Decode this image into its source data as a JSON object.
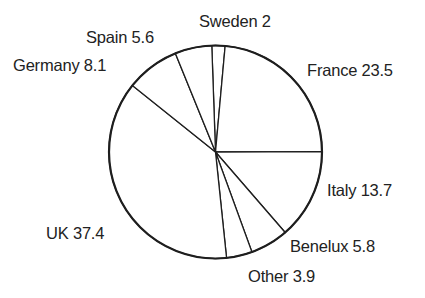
{
  "chart_data": {
    "type": "pie",
    "title": "",
    "slices": [
      {
        "label": "Sweden",
        "value": 2
      },
      {
        "label": "France",
        "value": 23.5
      },
      {
        "label": "Italy",
        "value": 13.7
      },
      {
        "label": "Benelux",
        "value": 5.8
      },
      {
        "label": "Other",
        "value": 3.9
      },
      {
        "label": "UK",
        "value": 37.4
      },
      {
        "label": "Germany",
        "value": 8.1
      },
      {
        "label": "Spain",
        "value": 5.6
      }
    ],
    "labels_text": [
      "Sweden 2",
      "France 23.5",
      "Italy 13.7",
      "Benelux 5.8",
      "Other 3.9",
      "UK 37.4",
      "Germany 8.1",
      "Spain 5.6"
    ],
    "start_angle_deg": -2,
    "direction": "clockwise",
    "legend": "none (inline labels)",
    "colors": {
      "fill": "#ffffff",
      "stroke": "#1e1e1e"
    }
  },
  "labels": {
    "sweden": "Sweden 2",
    "france": "France 23.5",
    "italy": "Italy 13.7",
    "benelux": "Benelux 5.8",
    "other": "Other 3.9",
    "uk": "UK 37.4",
    "germany": "Germany 8.1",
    "spain": "Spain 5.6"
  }
}
